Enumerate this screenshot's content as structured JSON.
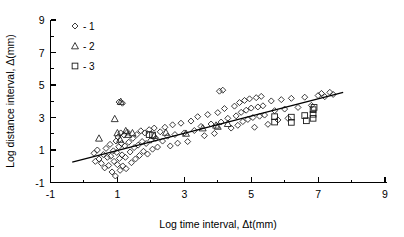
{
  "chart_data": {
    "type": "scatter",
    "title": "",
    "xlabel": "Log time interval, Δt(mm)",
    "ylabel": "Log distance interval, Δ(mm)",
    "xlim": [
      -1,
      9
    ],
    "ylim": [
      -1,
      9
    ],
    "xticks": [
      -1,
      1,
      3,
      5,
      7,
      9
    ],
    "yticks": [
      -1,
      1,
      3,
      5,
      7,
      9
    ],
    "xtick_labels": [
      "-1",
      "1",
      "3",
      "5",
      "7",
      "9"
    ],
    "ytick_labels": [
      "-1",
      "1",
      "3",
      "5",
      "7",
      "9"
    ],
    "minor_tick_step": 1,
    "grid": false,
    "legend_position": "top-left-inside",
    "legend": [
      {
        "label": "1",
        "marker": "diamond",
        "separator": "-"
      },
      {
        "label": "2",
        "marker": "triangle",
        "separator": "-"
      },
      {
        "label": "3",
        "marker": "square",
        "separator": "-"
      }
    ],
    "trendline": {
      "name": "regression-line",
      "x": [
        -0.35,
        7.75
      ],
      "y": [
        0.25,
        4.55
      ],
      "slope": 0.531,
      "intercept": 0.436
    },
    "series": [
      {
        "name": "1",
        "marker": "diamond",
        "points": [
          [
            0.3,
            0.8
          ],
          [
            0.34,
            0.3
          ],
          [
            0.4,
            1.0
          ],
          [
            0.45,
            0.45
          ],
          [
            0.52,
            0.18
          ],
          [
            0.58,
            0.72
          ],
          [
            0.62,
            -0.1
          ],
          [
            0.66,
            1.1
          ],
          [
            0.7,
            0.55
          ],
          [
            0.74,
            0.05
          ],
          [
            0.78,
            1.35
          ],
          [
            0.8,
            0.62
          ],
          [
            0.84,
            -0.35
          ],
          [
            0.88,
            0.95
          ],
          [
            0.9,
            0.3
          ],
          [
            0.94,
            -0.6
          ],
          [
            0.96,
            1.55
          ],
          [
            0.98,
            0.85
          ],
          [
            1.0,
            0.1
          ],
          [
            1.02,
            1.8
          ],
          [
            1.04,
            1.2
          ],
          [
            1.06,
            0.48
          ],
          [
            1.08,
            -0.25
          ],
          [
            1.1,
            2.05
          ],
          [
            1.12,
            1.4
          ],
          [
            1.14,
            0.7
          ],
          [
            1.16,
            0.02
          ],
          [
            1.2,
            1.92
          ],
          [
            1.22,
            1.25
          ],
          [
            1.24,
            0.55
          ],
          [
            1.26,
            -0.15
          ],
          [
            1.3,
            2.1
          ],
          [
            1.34,
            1.48
          ],
          [
            1.38,
            0.88
          ],
          [
            1.42,
            0.22
          ],
          [
            1.46,
            1.72
          ],
          [
            1.5,
            1.15
          ],
          [
            1.54,
            0.45
          ],
          [
            1.58,
            1.95
          ],
          [
            1.62,
            1.3
          ],
          [
            1.66,
            0.66
          ],
          [
            1.7,
            2.18
          ],
          [
            1.74,
            1.52
          ],
          [
            1.78,
            0.92
          ],
          [
            1.82,
            2.05
          ],
          [
            1.86,
            1.4
          ],
          [
            1.9,
            0.75
          ],
          [
            1.95,
            2.25
          ],
          [
            2.0,
            1.6
          ],
          [
            2.05,
            1.05
          ],
          [
            2.1,
            2.35
          ],
          [
            2.15,
            1.72
          ],
          [
            2.2,
            1.18
          ],
          [
            2.28,
            2.12
          ],
          [
            2.35,
            1.55
          ],
          [
            2.42,
            2.4
          ],
          [
            2.5,
            1.85
          ],
          [
            2.58,
            1.25
          ],
          [
            2.65,
            2.55
          ],
          [
            2.72,
            1.95
          ],
          [
            2.8,
            1.42
          ],
          [
            2.9,
            2.65
          ],
          [
            3.0,
            2.05
          ],
          [
            3.1,
            1.52
          ],
          [
            3.2,
            2.78
          ],
          [
            3.3,
            2.2
          ],
          [
            3.4,
            3.05
          ],
          [
            3.5,
            2.45
          ],
          [
            3.6,
            1.88
          ],
          [
            3.7,
            3.18
          ],
          [
            3.8,
            2.6
          ],
          [
            3.9,
            2.02
          ],
          [
            4.0,
            3.3
          ],
          [
            4.1,
            2.72
          ],
          [
            4.2,
            3.55
          ],
          [
            4.3,
            2.95
          ],
          [
            4.4,
            2.35
          ],
          [
            4.5,
            3.7
          ],
          [
            4.55,
            3.1
          ],
          [
            4.6,
            2.52
          ],
          [
            4.65,
            3.92
          ],
          [
            4.7,
            3.32
          ],
          [
            4.75,
            2.75
          ],
          [
            4.8,
            4.05
          ],
          [
            4.85,
            3.45
          ],
          [
            4.9,
            2.88
          ],
          [
            4.95,
            4.15
          ],
          [
            5.0,
            3.58
          ],
          [
            5.05,
            3.0
          ],
          [
            5.1,
            2.4
          ],
          [
            5.15,
            4.22
          ],
          [
            5.2,
            3.65
          ],
          [
            5.25,
            3.08
          ],
          [
            5.3,
            4.3
          ],
          [
            5.35,
            3.72
          ],
          [
            5.4,
            3.15
          ],
          [
            5.5,
            2.58
          ],
          [
            5.6,
            4.02
          ],
          [
            5.7,
            3.42
          ],
          [
            5.8,
            2.85
          ],
          [
            5.9,
            4.1
          ],
          [
            6.0,
            3.52
          ],
          [
            6.1,
            2.95
          ],
          [
            6.2,
            4.18
          ],
          [
            6.4,
            3.62
          ],
          [
            6.6,
            4.25
          ],
          [
            6.8,
            3.75
          ],
          [
            7.0,
            4.35
          ],
          [
            7.1,
            4.48
          ],
          [
            7.2,
            4.28
          ],
          [
            7.35,
            4.55
          ],
          [
            7.45,
            4.42
          ],
          [
            1.05,
            3.95
          ],
          [
            1.15,
            3.88
          ],
          [
            4.05,
            4.62
          ],
          [
            4.15,
            4.68
          ]
        ]
      },
      {
        "name": "2",
        "marker": "triangle",
        "points": [
          [
            0.45,
            1.72
          ],
          [
            0.92,
            2.92
          ],
          [
            1.0,
            2.05
          ],
          [
            1.08,
            1.65
          ],
          [
            1.25,
            2.18
          ],
          [
            1.32,
            1.95
          ],
          [
            1.45,
            2.05
          ],
          [
            2.1,
            1.88
          ],
          [
            2.45,
            2.08
          ],
          [
            3.05,
            2.02
          ],
          [
            3.55,
            2.35
          ],
          [
            3.95,
            2.52
          ],
          [
            4.0,
            2.45
          ],
          [
            4.3,
            2.62
          ],
          [
            1.1,
            3.98
          ]
        ]
      },
      {
        "name": "3",
        "marker": "square",
        "points": [
          [
            5.7,
            3.05
          ],
          [
            5.7,
            2.72
          ],
          [
            6.2,
            3.02
          ],
          [
            6.2,
            2.7
          ],
          [
            6.6,
            3.12
          ],
          [
            6.65,
            2.8
          ],
          [
            6.85,
            3.48
          ],
          [
            6.85,
            3.2
          ],
          [
            6.85,
            2.95
          ],
          [
            6.88,
            3.62
          ],
          [
            1.95,
            1.95
          ],
          [
            2.05,
            1.92
          ]
        ]
      }
    ]
  }
}
